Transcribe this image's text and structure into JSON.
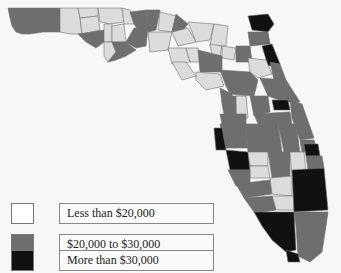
{
  "map": {
    "region": "Florida",
    "unit": "county",
    "classes": [
      {
        "id": "low",
        "label": "Less than $20,000",
        "color": "#dcdcdc"
      },
      {
        "id": "mid",
        "label": "$20,000 to $30,000",
        "color": "#6e6e6e"
      },
      {
        "id": "high",
        "label": "More than $30,000",
        "color": "#111111"
      }
    ]
  },
  "legend": {
    "items": [
      {
        "label": "Less than $20,000",
        "color": "#ffffff"
      },
      {
        "label": "$20,000 to $30,000",
        "color": "#6e6e6e"
      },
      {
        "label": "More than $30,000",
        "color": "#111111"
      }
    ]
  }
}
